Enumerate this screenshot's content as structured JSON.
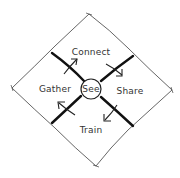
{
  "diagram": {
    "type": "cycle-diagram",
    "style": "hand-drawn sketch",
    "center": {
      "label": "See"
    },
    "quadrants": [
      {
        "label": "Connect",
        "position": "top"
      },
      {
        "label": "Share",
        "position": "right"
      },
      {
        "label": "Train",
        "position": "bottom"
      },
      {
        "label": "Gather",
        "position": "left"
      }
    ],
    "flow_direction": "clockwise",
    "colors": {
      "outline": "#555555",
      "divider": "#111111",
      "text": "#333333",
      "background": "#ffffff"
    }
  }
}
